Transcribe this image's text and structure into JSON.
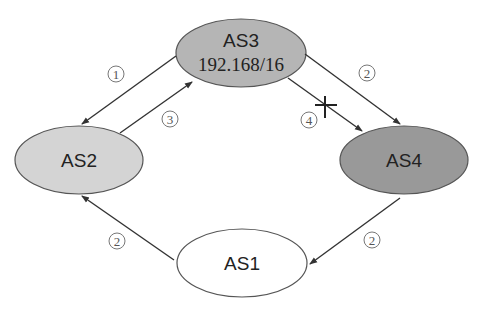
{
  "diagram": {
    "colors": {
      "as1_fill": "#ffffff",
      "as2_fill": "#d4d4d4",
      "as3_fill": "#b5b5b5",
      "as4_fill": "#999999",
      "edge": "#333333"
    },
    "nodes": {
      "as3": {
        "label": "AS3",
        "sublabel": "192.168/16"
      },
      "as2": {
        "label": "AS2"
      },
      "as4": {
        "label": "AS4"
      },
      "as1": {
        "label": "AS1"
      }
    },
    "edges": [
      {
        "from": "AS3",
        "to": "AS2",
        "step": "①"
      },
      {
        "from": "AS2",
        "to": "AS3",
        "step": "③"
      },
      {
        "from": "AS3",
        "to": "AS4",
        "step": "②"
      },
      {
        "from": "AS3",
        "to": "AS4",
        "step": "④",
        "blocked": true
      },
      {
        "from": "AS4",
        "to": "AS1",
        "step": "②"
      },
      {
        "from": "AS1",
        "to": "AS2",
        "step": "②"
      }
    ],
    "steps": {
      "s1": "1",
      "s2": "2",
      "s3": "3",
      "s4": "4"
    }
  }
}
